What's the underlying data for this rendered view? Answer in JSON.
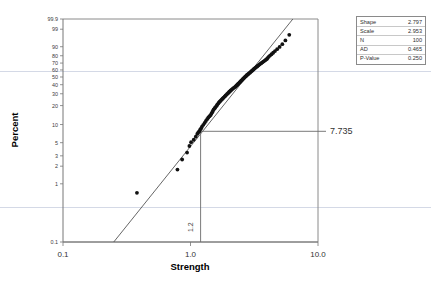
{
  "chart_data": {
    "type": "scatter",
    "title": "",
    "subtitle": "",
    "xlabel": "Strength",
    "ylabel": "Percent",
    "xscale": "log",
    "yscale": "weibull-probability",
    "xlim": [
      0.1,
      10.0
    ],
    "ylim": [
      0.1,
      99.9
    ],
    "grid": "faint-horizontal",
    "legend_position": "right-outside",
    "x_tick_labels": [
      "0.1",
      "1.0",
      "10.0"
    ],
    "x_tick_values": [
      0.1,
      1.0,
      10.0
    ],
    "y_tick_labels": [
      "99.9",
      "99",
      "90",
      "80",
      "70",
      "60",
      "50",
      "40",
      "30",
      "20",
      "10",
      "5",
      "3",
      "2",
      "1",
      "0.1"
    ],
    "y_tick_values": [
      99.9,
      99,
      90,
      80,
      70,
      60,
      50,
      40,
      30,
      20,
      10,
      5,
      3,
      2,
      1,
      0.1
    ],
    "annotations": [
      {
        "name": "percent-readout",
        "text": "7.735",
        "at_percent": 7.735
      },
      {
        "name": "strength-readout",
        "text": "1.2",
        "at_strength": 1.2
      }
    ],
    "series": [
      {
        "name": "Strength data points",
        "marker": "filled-circle",
        "color": "#111111",
        "n": 100,
        "points": [
          [
            0.38,
            0.7
          ],
          [
            0.79,
            1.75
          ],
          [
            0.86,
            2.6
          ],
          [
            0.94,
            3.4
          ],
          [
            0.98,
            4.4
          ],
          [
            1.01,
            5.1
          ],
          [
            1.06,
            5.6
          ],
          [
            1.1,
            6.3
          ],
          [
            1.13,
            7.0
          ],
          [
            1.15,
            7.4
          ],
          [
            1.17,
            7.7
          ],
          [
            1.19,
            8.2
          ],
          [
            1.21,
            8.6
          ],
          [
            1.23,
            9.2
          ],
          [
            1.26,
            9.9
          ],
          [
            1.29,
            10.6
          ],
          [
            1.32,
            11.4
          ],
          [
            1.35,
            12.2
          ],
          [
            1.38,
            13.0
          ],
          [
            1.41,
            13.6
          ],
          [
            1.44,
            14.2
          ],
          [
            1.46,
            15.0
          ],
          [
            1.48,
            15.8
          ],
          [
            1.5,
            16.6
          ],
          [
            1.52,
            17.4
          ],
          [
            1.55,
            18.2
          ],
          [
            1.57,
            19.0
          ],
          [
            1.6,
            19.8
          ],
          [
            1.62,
            20.6
          ],
          [
            1.65,
            21.5
          ],
          [
            1.67,
            22.3
          ],
          [
            1.7,
            23.1
          ],
          [
            1.73,
            23.9
          ],
          [
            1.76,
            24.8
          ],
          [
            1.79,
            25.6
          ],
          [
            1.82,
            26.4
          ],
          [
            1.85,
            27.3
          ],
          [
            1.88,
            28.1
          ],
          [
            1.91,
            29.0
          ],
          [
            1.94,
            29.8
          ],
          [
            1.97,
            30.6
          ],
          [
            2.0,
            31.5
          ],
          [
            2.03,
            32.3
          ],
          [
            2.06,
            33.2
          ],
          [
            2.09,
            34.0
          ],
          [
            2.13,
            34.9
          ],
          [
            2.16,
            35.7
          ],
          [
            2.2,
            36.6
          ],
          [
            2.24,
            37.4
          ],
          [
            2.27,
            38.3
          ],
          [
            2.3,
            39.1
          ],
          [
            2.33,
            40.0
          ],
          [
            2.36,
            40.9
          ],
          [
            2.39,
            41.7
          ],
          [
            2.42,
            42.6
          ],
          [
            2.45,
            43.5
          ],
          [
            2.48,
            44.3
          ],
          [
            2.51,
            45.2
          ],
          [
            2.54,
            46.1
          ],
          [
            2.57,
            47.0
          ],
          [
            2.6,
            47.9
          ],
          [
            2.63,
            48.8
          ],
          [
            2.66,
            49.7
          ],
          [
            2.7,
            50.6
          ],
          [
            2.73,
            51.5
          ],
          [
            2.76,
            52.4
          ],
          [
            2.8,
            53.3
          ],
          [
            2.84,
            54.2
          ],
          [
            2.88,
            55.2
          ],
          [
            2.92,
            56.1
          ],
          [
            2.96,
            57.0
          ],
          [
            3.0,
            58.0
          ],
          [
            3.04,
            58.9
          ],
          [
            3.08,
            59.9
          ],
          [
            3.12,
            60.8
          ],
          [
            3.16,
            61.8
          ],
          [
            3.21,
            62.8
          ],
          [
            3.26,
            63.8
          ],
          [
            3.31,
            64.8
          ],
          [
            3.36,
            65.8
          ],
          [
            3.41,
            66.8
          ],
          [
            3.47,
            67.8
          ],
          [
            3.53,
            68.9
          ],
          [
            3.59,
            69.9
          ],
          [
            3.66,
            71.0
          ],
          [
            3.73,
            72.1
          ],
          [
            3.8,
            73.2
          ],
          [
            3.88,
            74.3
          ],
          [
            3.96,
            75.5
          ],
          [
            4.02,
            77.0
          ],
          [
            4.1,
            78.6
          ],
          [
            4.2,
            80.2
          ],
          [
            4.32,
            81.9
          ],
          [
            4.45,
            83.7
          ],
          [
            4.6,
            85.6
          ],
          [
            4.78,
            87.6
          ],
          [
            5.0,
            89.8
          ],
          [
            5.25,
            92.2
          ],
          [
            5.55,
            94.8
          ],
          [
            5.95,
            97.5
          ]
        ]
      }
    ],
    "fit_line": {
      "name": "Weibull fit line",
      "color": "#555555",
      "from": [
        0.25,
        0.1
      ],
      "to": [
        6.35,
        99.9
      ]
    },
    "crosshair": {
      "name": "readout-crosshair",
      "x_strength": 1.2,
      "y_percent": 7.735,
      "color": "#6b6b6b"
    }
  },
  "statistics_box": {
    "name": "statistics-legend",
    "rows": [
      {
        "label": "Shape",
        "value": "2.797"
      },
      {
        "label": "Scale",
        "value": "2.953"
      },
      {
        "label": "N",
        "value": "100"
      },
      {
        "label": "AD",
        "value": "0.465"
      },
      {
        "label": "P-Value",
        "value": "0.250"
      }
    ]
  },
  "colors": {
    "marker": "#111111",
    "fit_line": "#555555",
    "frame": "#8a8a8a",
    "gridline": "#c9cfe0",
    "text": "#333333"
  }
}
